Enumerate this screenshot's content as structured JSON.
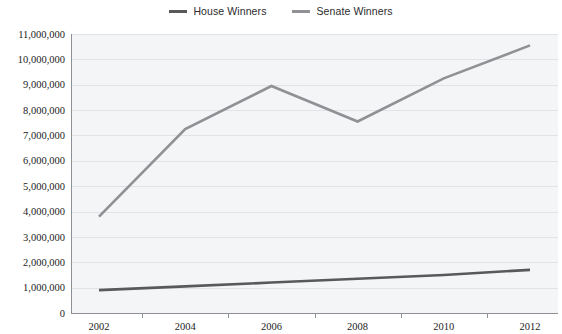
{
  "chart_data": {
    "type": "line",
    "title": "",
    "subtitle": "",
    "xlabel": "",
    "ylabel": "",
    "x": [
      2002,
      2004,
      2006,
      2008,
      2010,
      2012
    ],
    "xtick_labels": [
      "2002",
      "2004",
      "2006",
      "2008",
      "2010",
      "2012"
    ],
    "ytick_labels": [
      "0",
      "1,000,000",
      "2,000,000",
      "3,000,000",
      "4,000,000",
      "5,000,000",
      "6,000,000",
      "7,000,000",
      "8,000,000",
      "9,000,000",
      "10,000,000",
      "11,000,000"
    ],
    "ytick_values": [
      0,
      1000000,
      2000000,
      3000000,
      4000000,
      5000000,
      6000000,
      7000000,
      8000000,
      9000000,
      10000000,
      11000000
    ],
    "ylim": [
      0,
      11000000
    ],
    "xlim": [
      2002,
      2012
    ],
    "grid": true,
    "legend_position": "top-center",
    "series": [
      {
        "name": "House Winners",
        "color": "#595959",
        "values": [
          900000,
          1050000,
          1200000,
          1350000,
          1500000,
          1700000
        ]
      },
      {
        "name": "Senate Winners",
        "color": "#8f9194",
        "values": [
          3800000,
          7250000,
          8950000,
          7550000,
          9250000,
          10550000
        ]
      }
    ]
  },
  "legend": {
    "entries": [
      {
        "label": "House Winners",
        "color": "#595959"
      },
      {
        "label": "Senate Winners",
        "color": "#8f9194"
      }
    ]
  },
  "colors": {
    "plot_background": "#f4f5f6",
    "gridline": "#d9dde0",
    "axis": "#8d9195",
    "text": "#1c1c1c",
    "page_background": "#ffffff"
  }
}
